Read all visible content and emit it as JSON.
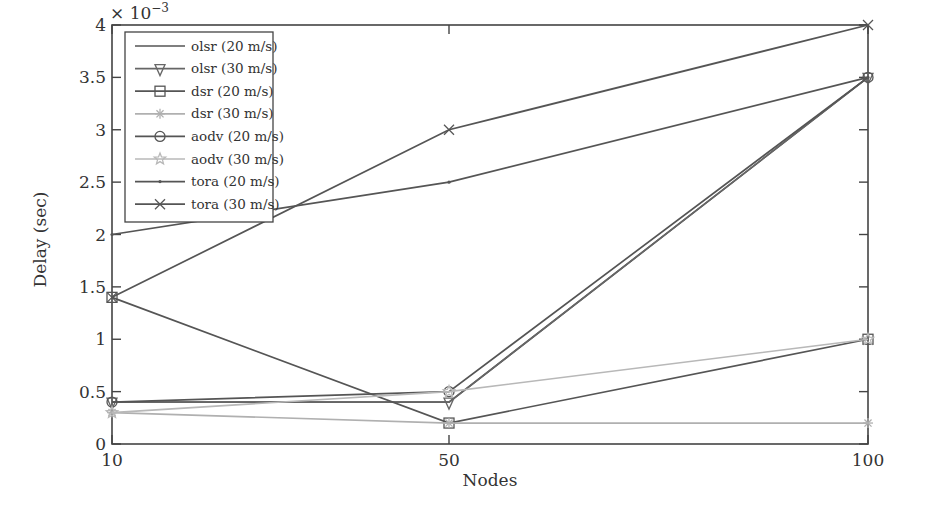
{
  "chart_data": {
    "type": "line",
    "title": "",
    "xlabel": "Nodes",
    "ylabel": "Delay (sec)",
    "y_multiplier": "× 10",
    "y_multiplier_exp": "−3",
    "x": [
      10,
      50,
      100
    ],
    "x_tick_labels": [
      "10",
      "50",
      "100"
    ],
    "y_ticks": [
      0,
      0.5,
      1,
      1.5,
      2,
      2.5,
      3,
      3.5,
      4
    ],
    "y_tick_labels": [
      "0",
      "0.5",
      "1",
      "1.5",
      "2",
      "2.5",
      "3",
      "3.5",
      "4"
    ],
    "ylim": [
      0,
      4
    ],
    "xlim": [
      10,
      100
    ],
    "grid": false,
    "legend_position": "upper left",
    "series": [
      {
        "name": "olsr (20 m/s)",
        "values": [
          0.4,
          0.4,
          3.5
        ],
        "color": "#555555",
        "marker": "none"
      },
      {
        "name": "olsr (30 m/s)",
        "values": [
          0.4,
          0.4,
          3.5
        ],
        "color": "#666666",
        "marker": "triangle-down"
      },
      {
        "name": "dsr (20 m/s)",
        "values": [
          1.4,
          0.2,
          1.0
        ],
        "color": "#555555",
        "marker": "square"
      },
      {
        "name": "dsr (30 m/s)",
        "values": [
          0.3,
          0.2,
          0.2
        ],
        "color": "#b0b0b0",
        "marker": "asterisk"
      },
      {
        "name": "aodv (20 m/s)",
        "values": [
          0.4,
          0.5,
          3.5
        ],
        "color": "#555555",
        "marker": "circle"
      },
      {
        "name": "aodv (30 m/s)",
        "values": [
          0.3,
          0.5,
          1.0
        ],
        "color": "#b8b8b8",
        "marker": "star"
      },
      {
        "name": "tora (20 m/s)",
        "values": [
          2.0,
          2.5,
          3.5
        ],
        "color": "#555555",
        "marker": "dot"
      },
      {
        "name": "tora (30 m/s)",
        "values": [
          1.4,
          3.0,
          4.0
        ],
        "color": "#555555",
        "marker": "x"
      }
    ]
  }
}
